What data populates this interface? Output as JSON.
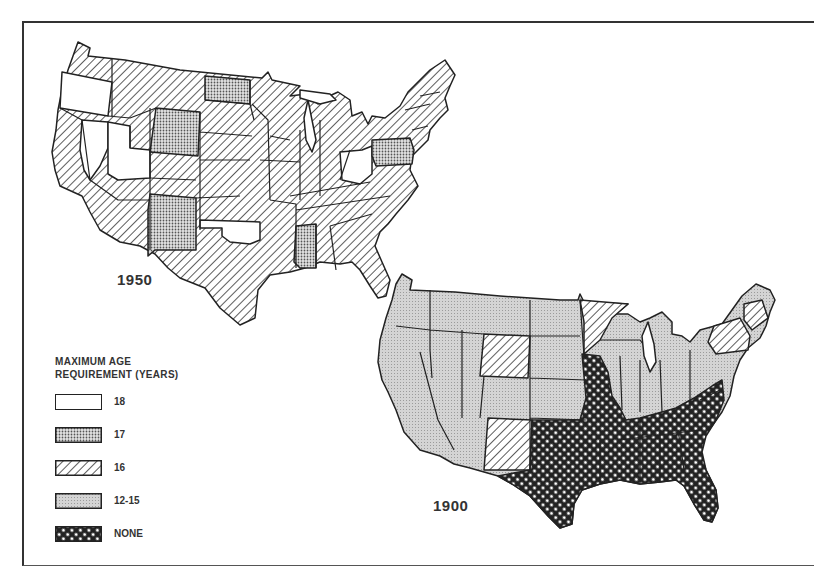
{
  "figure": {
    "maps": [
      {
        "year_label": "1950",
        "position": "upper-left"
      },
      {
        "year_label": "1900",
        "position": "lower-right"
      }
    ],
    "legend": {
      "title_line1": "MAXIMUM AGE",
      "title_line2": "REQUIREMENT (YEARS)",
      "items": [
        {
          "label": "18",
          "pattern": "blank"
        },
        {
          "label": "17",
          "pattern": "fine-dots"
        },
        {
          "label": "16",
          "pattern": "diagonal-hatch"
        },
        {
          "label": "12-15",
          "pattern": "light-stipple"
        },
        {
          "label": "NONE",
          "pattern": "dark-crosshatch"
        }
      ]
    },
    "colors": {
      "ink": "#222222",
      "background": "#ffffff",
      "stipple_fill": "#cfcfcf"
    }
  }
}
